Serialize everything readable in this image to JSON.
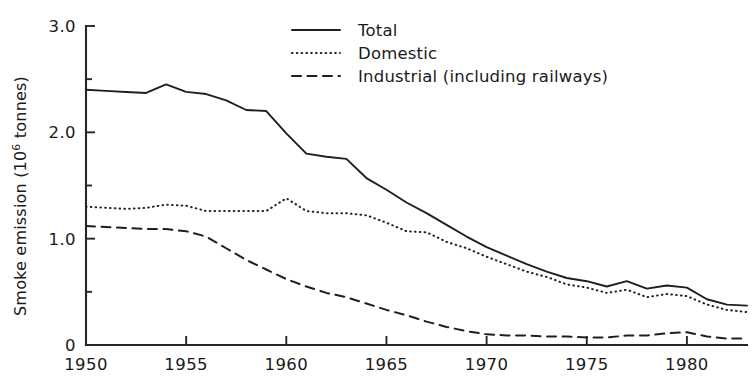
{
  "chart_data": {
    "type": "line",
    "title": "",
    "xlabel": "",
    "ylabel": "Smoke emission (10⁶ tonnes)",
    "ylabel_main": "Smoke emission (10",
    "ylabel_sup": "6",
    "ylabel_tail": " tonnes)",
    "xlim": [
      1950,
      1983
    ],
    "ylim": [
      0,
      3.0
    ],
    "grid": false,
    "legend_position": "top-right",
    "x_ticks": [
      1950,
      1955,
      1960,
      1965,
      1970,
      1975,
      1980
    ],
    "x_tick_labels": [
      "1950",
      "1955",
      "1960",
      "1965",
      "1970",
      "1975",
      "1980"
    ],
    "y_ticks": [
      0,
      1.0,
      2.0,
      3.0
    ],
    "y_tick_labels": [
      "0",
      "1.0",
      "2.0",
      "3.0"
    ],
    "y_minor_ticks": [
      0.5,
      1.5,
      2.5
    ],
    "x": [
      1950,
      1951,
      1952,
      1953,
      1954,
      1955,
      1956,
      1957,
      1958,
      1959,
      1960,
      1961,
      1962,
      1963,
      1964,
      1965,
      1966,
      1967,
      1968,
      1969,
      1970,
      1971,
      1972,
      1973,
      1974,
      1975,
      1976,
      1977,
      1978,
      1979,
      1980,
      1981,
      1982,
      1983
    ],
    "series": [
      {
        "name": "Total",
        "style": "solid",
        "color": "#1f1f1f",
        "values": [
          2.4,
          2.39,
          2.38,
          2.37,
          2.45,
          2.38,
          2.36,
          2.3,
          2.21,
          2.2,
          1.99,
          1.8,
          1.77,
          1.75,
          1.57,
          1.46,
          1.34,
          1.24,
          1.13,
          1.02,
          0.92,
          0.84,
          0.76,
          0.69,
          0.63,
          0.6,
          0.55,
          0.6,
          0.53,
          0.56,
          0.54,
          0.43,
          0.38,
          0.37
        ]
      },
      {
        "name": "Domestic",
        "style": "dotted",
        "color": "#1f1f1f",
        "values": [
          1.3,
          1.29,
          1.28,
          1.29,
          1.32,
          1.31,
          1.26,
          1.26,
          1.26,
          1.26,
          1.38,
          1.26,
          1.24,
          1.24,
          1.22,
          1.15,
          1.07,
          1.06,
          0.97,
          0.91,
          0.83,
          0.76,
          0.69,
          0.64,
          0.57,
          0.54,
          0.49,
          0.52,
          0.45,
          0.48,
          0.46,
          0.38,
          0.33,
          0.31
        ]
      },
      {
        "name": "Industrial (including railways)",
        "style": "dashed",
        "color": "#1f1f1f",
        "values": [
          1.12,
          1.11,
          1.1,
          1.09,
          1.09,
          1.07,
          1.02,
          0.91,
          0.8,
          0.71,
          0.62,
          0.55,
          0.49,
          0.45,
          0.39,
          0.33,
          0.28,
          0.22,
          0.17,
          0.13,
          0.1,
          0.09,
          0.09,
          0.08,
          0.08,
          0.07,
          0.07,
          0.09,
          0.09,
          0.11,
          0.12,
          0.08,
          0.06,
          0.06
        ]
      }
    ],
    "legend": [
      {
        "label": "Total",
        "style": "solid"
      },
      {
        "label": "Domestic",
        "style": "dotted"
      },
      {
        "label": "Industrial (including railways)",
        "style": "dashed"
      }
    ]
  }
}
